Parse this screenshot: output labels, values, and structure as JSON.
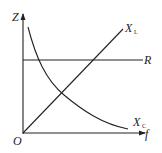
{
  "diagram": {
    "type": "impedance-vs-frequency",
    "axes": {
      "y_label": "Z",
      "x_label": "f",
      "origin_label": "O"
    },
    "curves": [
      {
        "id": "R",
        "label": "R",
        "shape": "horizontal line"
      },
      {
        "id": "XL",
        "label_main": "X",
        "label_sub": "L",
        "shape": "straight line through origin"
      },
      {
        "id": "XC",
        "label_main": "X",
        "label_sub": "C",
        "shape": "decreasing hyperbola"
      }
    ],
    "colors": {
      "stroke": "#222222",
      "background": "#ffffff"
    }
  }
}
